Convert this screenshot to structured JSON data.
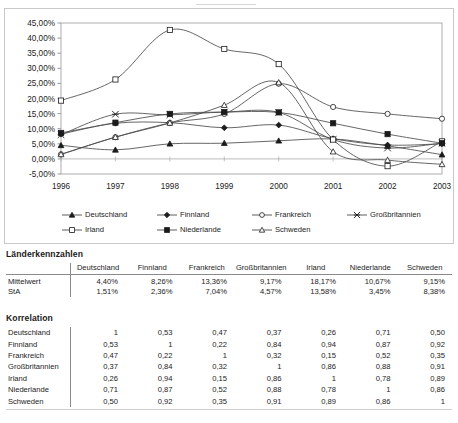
{
  "chart_data": {
    "type": "line",
    "title": "",
    "xlabel": "",
    "ylabel": "",
    "x": [
      1996,
      1997,
      1998,
      1999,
      2000,
      2001,
      2002,
      2003
    ],
    "xtick_labels": [
      "1996",
      "1997",
      "1998",
      "1999",
      "2000",
      "2001",
      "2002",
      "2003"
    ],
    "ytick_labels": [
      "45,00%",
      "40,00%",
      "35,00%",
      "30,00%",
      "25,00%",
      "20,00%",
      "15,00%",
      "10,00%",
      "5,00%",
      "0,00%",
      "-5,00%"
    ],
    "ylim": [
      -5,
      45
    ],
    "ytick_step": 5,
    "grid": false,
    "legend_position": "bottom",
    "value_suffix": "%",
    "series": [
      {
        "name": "Deutschland",
        "marker": "filled-triangle",
        "values": [
          4.5,
          3.0,
          5.0,
          5.2,
          6.0,
          6.6,
          4.3,
          1.4
        ]
      },
      {
        "name": "Finnland",
        "marker": "filled-diamond",
        "values": [
          8.2,
          11.8,
          12.0,
          10.3,
          11.2,
          6.7,
          4.6,
          5.0
        ]
      },
      {
        "name": "Frankreich",
        "marker": "open-circle",
        "values": [
          1.5,
          7.2,
          11.9,
          14.9,
          24.9,
          17.2,
          14.9,
          13.3
        ]
      },
      {
        "name": "Großbritannien",
        "marker": "asterisk",
        "values": [
          8.0,
          14.8,
          14.6,
          15.5,
          15.4,
          6.4,
          3.6,
          5.2
        ]
      },
      {
        "name": "Irland",
        "marker": "open-square",
        "values": [
          19.3,
          26.3,
          42.7,
          36.4,
          31.4,
          6.4,
          -2.4,
          5.8
        ]
      },
      {
        "name": "Niederlande",
        "marker": "filled-square",
        "values": [
          8.6,
          12.0,
          14.9,
          15.5,
          15.4,
          11.8,
          8.2,
          5.2
        ]
      },
      {
        "name": "Schweden",
        "marker": "open-triangle",
        "values": [
          1.5,
          7.2,
          11.9,
          17.8,
          25.3,
          2.4,
          -0.4,
          -1.8
        ]
      }
    ]
  },
  "legend": {
    "row1": [
      {
        "label": "Deutschland",
        "marker": "filled-triangle"
      },
      {
        "label": "Finnland",
        "marker": "filled-diamond"
      },
      {
        "label": "Frankreich",
        "marker": "open-circle"
      },
      {
        "label": "Großbritannien",
        "marker": "asterisk"
      }
    ],
    "row2": [
      {
        "label": "Irland",
        "marker": "open-square"
      },
      {
        "label": "Niederlande",
        "marker": "filled-square"
      },
      {
        "label": "Schweden",
        "marker": "open-triangle"
      }
    ]
  },
  "laenderkennzahlen": {
    "title": "Länderkennzahlen",
    "columns": [
      "Deutschland",
      "Finnland",
      "Frankreich",
      "Großbritannien",
      "Irland",
      "Niederlande",
      "Schweden"
    ],
    "rows": [
      {
        "label": "Mittelwert",
        "values": [
          "4,40%",
          "8,26%",
          "13,36%",
          "9,17%",
          "18,17%",
          "10,67%",
          "9,15%"
        ]
      },
      {
        "label": "StA",
        "values": [
          "1,51%",
          "2,36%",
          "7,04%",
          "4,57%",
          "13,58%",
          "3,45%",
          "8,38%"
        ]
      }
    ]
  },
  "korrelation": {
    "title": "Korrelation",
    "rows": [
      {
        "label": "Deutschland",
        "values": [
          "1",
          "0,53",
          "0,47",
          "0,37",
          "0,26",
          "0,71",
          "0,50"
        ]
      },
      {
        "label": "Finnland",
        "values": [
          "0,53",
          "1",
          "0,22",
          "0,84",
          "0,94",
          "0,87",
          "0,92"
        ]
      },
      {
        "label": "Frankreich",
        "values": [
          "0,47",
          "0,22",
          "1",
          "0,32",
          "0,15",
          "0,52",
          "0,35"
        ]
      },
      {
        "label": "Großbritannien",
        "values": [
          "0,37",
          "0,84",
          "0,32",
          "1",
          "0,86",
          "0,88",
          "0,91"
        ]
      },
      {
        "label": "Irland",
        "values": [
          "0,26",
          "0,94",
          "0,15",
          "0,86",
          "1",
          "0,78",
          "0,89"
        ]
      },
      {
        "label": "Niederlande",
        "values": [
          "0,71",
          "0,87",
          "0,52",
          "0,88",
          "0,78",
          "1",
          "0,86"
        ]
      },
      {
        "label": "Schweden",
        "values": [
          "0,50",
          "0,92",
          "0,35",
          "0,91",
          "0,89",
          "0,86",
          "1"
        ]
      }
    ]
  },
  "colors": {
    "ink": "#1b1b1b",
    "line": "#4a4a4a",
    "rule": "#8a8a8a",
    "frame": "#c9c9c9",
    "background": "#ffffff"
  }
}
